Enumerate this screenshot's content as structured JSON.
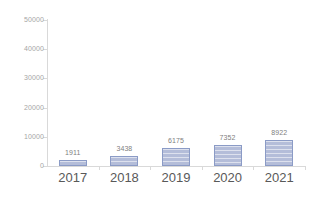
{
  "chart_data": {
    "type": "bar",
    "title": "",
    "subtitle": "",
    "xlabel": "",
    "ylabel": "",
    "categories": [
      "2017",
      "2018",
      "2019",
      "2020",
      "2021"
    ],
    "values": [
      1911,
      3438,
      6175,
      7352,
      8922
    ],
    "data_labels": [
      "1911",
      "3438",
      "6175",
      "7352",
      "8922"
    ],
    "series": [
      {
        "name": "",
        "values": [
          1911,
          3438,
          6175,
          7352,
          8922
        ],
        "color": "#b4bdd9",
        "border_color": "#8b9bc6"
      }
    ],
    "ylim": [
      0,
      50000
    ],
    "yticks": [
      0,
      10000,
      20000,
      30000,
      40000,
      50000
    ],
    "ytick_labels": [
      "0",
      "10000",
      "20000",
      "30000",
      "40000",
      "50000"
    ],
    "grid": false,
    "legend": null,
    "legend_position": "none",
    "axis_color": "#d9d9d9",
    "tick_label_color": "#a6a6a6",
    "category_label_color": "#595959",
    "data_label_color": "#808080",
    "background_color": "#ffffff"
  }
}
